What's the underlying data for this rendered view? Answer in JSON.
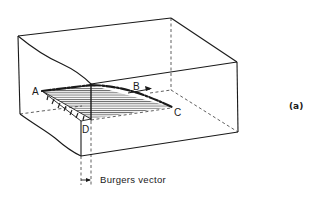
{
  "figure": {
    "panel_label": "(a)",
    "point_labels": {
      "A": "A",
      "B": "B",
      "C": "C",
      "D": "D"
    },
    "caption": "Burgers vector"
  },
  "colors": {
    "ink": "#1a1a1a",
    "background": "#ffffff"
  }
}
